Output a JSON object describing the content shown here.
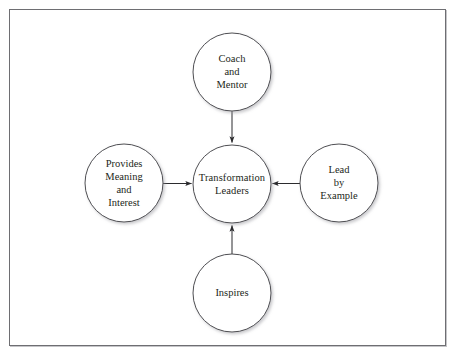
{
  "canvas": {
    "width": 461,
    "height": 360,
    "background_color": "#ffffff",
    "frame_color": "#6e6e72"
  },
  "diagram": {
    "type": "hub-and-spoke",
    "node_stroke_color": "#3a3a3e",
    "node_fill_color": "#ffffff",
    "connector_color": "#2b2b2e",
    "text_color": "#231f20",
    "center": {
      "id": "transformation-leaders",
      "label": "Transformation\nLeaders",
      "cx": 232,
      "cy": 184,
      "r": 39
    },
    "spokes": [
      {
        "id": "coach-and-mentor",
        "label": "Coach\nand\nMentor",
        "cx": 232,
        "cy": 72,
        "r": 39,
        "position": "top",
        "arrow_direction": "down"
      },
      {
        "id": "provides-meaning-and-interest",
        "label": "Provides\nMeaning\nand\nInterest",
        "cx": 124,
        "cy": 183,
        "r": 39,
        "position": "left",
        "arrow_direction": "right"
      },
      {
        "id": "lead-by-example",
        "label": "Lead\nby\nExample",
        "cx": 339,
        "cy": 183,
        "r": 39,
        "position": "right",
        "arrow_direction": "left"
      },
      {
        "id": "inspires",
        "label": "Inspires",
        "cx": 232,
        "cy": 293,
        "r": 39,
        "position": "bottom",
        "arrow_direction": "up"
      }
    ]
  }
}
